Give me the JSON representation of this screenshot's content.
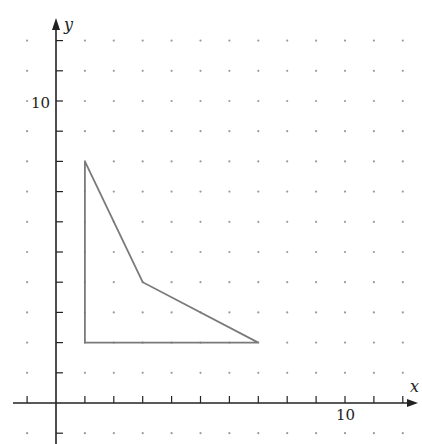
{
  "chart_data": {
    "type": "line",
    "title": "",
    "xlabel": "x",
    "ylabel": "y",
    "xlim": [
      -1.5,
      12.5
    ],
    "ylim": [
      -1.4,
      12.6
    ],
    "grid": "dots",
    "tick_labels": {
      "x": [
        "10"
      ],
      "y": [
        "10"
      ]
    },
    "x_ticks": [
      -1,
      1,
      2,
      3,
      4,
      5,
      6,
      7,
      8,
      9,
      10,
      11,
      12
    ],
    "y_ticks": [
      -1,
      1,
      2,
      3,
      4,
      5,
      6,
      7,
      8,
      9,
      10,
      11,
      12
    ],
    "series": [
      {
        "name": "polygon",
        "closed": true,
        "points": [
          [
            1,
            8
          ],
          [
            3,
            4
          ],
          [
            7,
            2
          ],
          [
            1,
            2
          ]
        ]
      }
    ]
  },
  "labels": {
    "x_axis": "x",
    "y_axis": "y",
    "x_tick_10": "10",
    "y_tick_10": "10"
  },
  "colors": {
    "axis": "#222222",
    "shape": "#7a7a7a",
    "dots": "#9a9a9a"
  }
}
